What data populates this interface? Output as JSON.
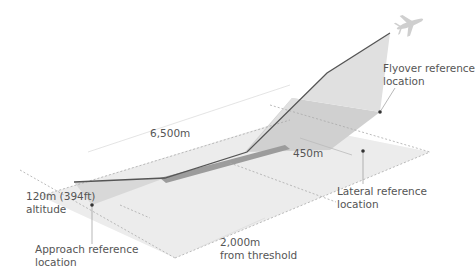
{
  "diagram": {
    "labels": {
      "length": "6,500m",
      "lateral_distance": "450m",
      "altitude_line1": "120m (394ft)",
      "altitude_line2": "altitude",
      "approach_line1": "Approach reference",
      "approach_line2": "location",
      "flyover_line1": "Flyover reference",
      "flyover_line2": "location",
      "lateral_line1": "Lateral reference",
      "lateral_line2": "location",
      "threshold_line1": "2,000m",
      "threshold_line2": "from threshold"
    },
    "icons": {
      "aircraft": "airplane-icon"
    },
    "colors": {
      "ground": "#ebebeb",
      "shaded": "#d2d2d2",
      "runway": "#9a9a9a",
      "flight_path": "#555555",
      "dashed": "#aaaaaa",
      "text": "#555555"
    }
  }
}
